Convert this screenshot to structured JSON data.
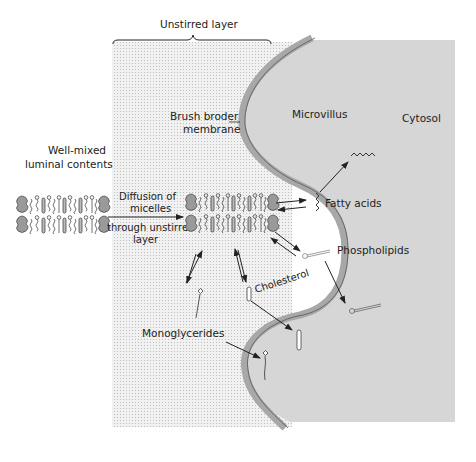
{
  "diagram": {
    "colors": {
      "background": "#ffffff",
      "unstirred_layer_fill": "#ededed",
      "unstirred_layer_dot": "#bdbdbd",
      "cytosol": "#d6d6d6",
      "membrane_fill": "#a8a8a8",
      "line": "#222222"
    },
    "regions": {
      "unstirred_layer": "Unstirred layer",
      "luminal": {
        "line1": "Well-mixed",
        "line2": "luminal contents"
      },
      "membrane": {
        "line1": "Brush broder",
        "line2": "membrane"
      },
      "microvillus": "Microvillus",
      "cytosol": "Cytosol"
    },
    "process": {
      "diffusion": {
        "line1": "Diffusion of",
        "line2": "micelles",
        "line3": "through unstirred",
        "line4": "layer"
      }
    },
    "molecules": {
      "fatty_acids": "Fatty acids",
      "phospholipids": "Phospholipids",
      "cholesterol": "Cholesterol",
      "monoglycerides": "Monoglycerides"
    }
  }
}
